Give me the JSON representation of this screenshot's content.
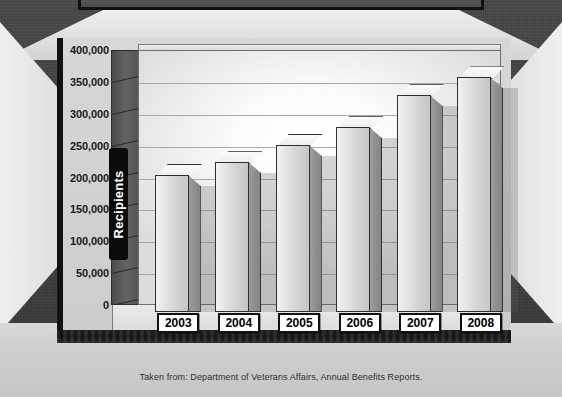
{
  "banner": {
    "mark_icon": "dot-marker"
  },
  "chart_data": {
    "type": "bar",
    "title": "",
    "subtitle": "",
    "xlabel": "",
    "ylabel": "Recipients",
    "categories": [
      "2003",
      "2004",
      "2005",
      "2006",
      "2007",
      "2008"
    ],
    "values": [
      215000,
      235000,
      262000,
      290000,
      340000,
      368000
    ],
    "ylim": [
      0,
      400000
    ],
    "ytick_step": 50000,
    "ytick_labels": [
      "400,000",
      "350,000",
      "300,000",
      "250,000",
      "200,000",
      "150,000",
      "100,000",
      "50,000",
      "0"
    ],
    "ytick_values": [
      400000,
      350000,
      300000,
      250000,
      200000,
      150000,
      100000,
      50000,
      0
    ],
    "grid": true,
    "legend": false,
    "legend_position": "none",
    "style": "3d-column",
    "bar_face_color": "#e4e4e4",
    "bar_side_color": "#909090",
    "bar_top_color": "#f4f4f4",
    "bar_outline_color": "#2f2f2f"
  },
  "footer": {
    "caption": "Taken from: Department of Veterans Affairs, Annual Benefits Reports."
  },
  "colors": {
    "backdrop": "#3f3f3f",
    "frame_light": "#e2e2e2",
    "panel": "#d2d2d2",
    "axis_band": "#0b0b0b",
    "axis_band_text": "#ffffff",
    "gridline": "#a9a9a9",
    "label_box_bg": "#ffffff",
    "label_box_border": "#111111"
  }
}
